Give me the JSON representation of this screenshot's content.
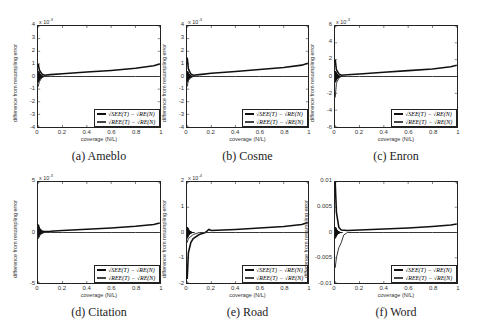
{
  "chart_data": [
    {
      "id": "a",
      "type": "line",
      "caption": "(a) Ameblo",
      "xlabel": "coverage (N/L)",
      "ylabel": "difference from resampling error",
      "y_exponent": "x 10^-3",
      "y_exponent_base": "x 10",
      "y_exponent_power": "-3",
      "xlim": [
        0,
        1
      ],
      "ylim": [
        -4,
        4
      ],
      "xticks": [
        "0",
        "0.2",
        "0.4",
        "0.6",
        "0.8",
        "1"
      ],
      "yticks": [
        "4",
        "3",
        "2",
        "1",
        "0",
        "-1",
        "-2",
        "-3",
        "-4"
      ],
      "legend": [
        "√SEE(T) − √RE(N)",
        "√REE(T) − √RE(N)"
      ],
      "legend_position": "lower right",
      "grid": false,
      "series": [
        {
          "name": "√SEE(T) − √RE(N)",
          "x": [
            0,
            0.01,
            0.03,
            0.05,
            0.1,
            0.2,
            0.4,
            0.6,
            0.8,
            0.95,
            1.0
          ],
          "values": [
            1.0,
            0.5,
            0.2,
            0.1,
            0.15,
            0.22,
            0.35,
            0.48,
            0.65,
            0.85,
            1.0
          ]
        },
        {
          "name": "√REE(T) − √RE(N)",
          "x": [
            0,
            0.01,
            0.03,
            0.05,
            0.1,
            0.2,
            0.4,
            0.6,
            0.8,
            1.0
          ],
          "values": [
            -0.8,
            -0.4,
            -0.1,
            0.0,
            0.0,
            0.0,
            0.0,
            0.0,
            0.0,
            0.0
          ]
        }
      ]
    },
    {
      "id": "b",
      "type": "line",
      "caption": "(b) Cosme",
      "xlabel": "coverage (N/L)",
      "ylabel": "difference from resampling error",
      "y_exponent": "x 10^-3",
      "y_exponent_base": "x 10",
      "y_exponent_power": "-3",
      "xlim": [
        0,
        1
      ],
      "ylim": [
        -4,
        4
      ],
      "xticks": [
        "0",
        "0.2",
        "0.4",
        "0.6",
        "0.8",
        "1"
      ],
      "yticks": [
        "4",
        "3",
        "2",
        "1",
        "0",
        "-1",
        "-2",
        "-3",
        "-4"
      ],
      "legend": [
        "√SEE(T) − √RE(N)",
        "√REE(T) − √RE(N)"
      ],
      "legend_position": "lower right",
      "grid": false,
      "series": [
        {
          "name": "√SEE(T) − √RE(N)",
          "x": [
            0,
            0.01,
            0.03,
            0.05,
            0.1,
            0.2,
            0.4,
            0.6,
            0.8,
            0.95,
            1.0
          ],
          "values": [
            1.5,
            0.6,
            0.2,
            0.1,
            0.15,
            0.25,
            0.4,
            0.55,
            0.72,
            0.9,
            1.05
          ]
        },
        {
          "name": "√REE(T) − √RE(N)",
          "x": [
            0,
            0.01,
            0.03,
            0.05,
            0.1,
            0.2,
            0.4,
            0.6,
            0.8,
            1.0
          ],
          "values": [
            -0.8,
            -0.3,
            -0.1,
            0.0,
            0.0,
            0.0,
            0.0,
            0.0,
            0.0,
            0.0
          ]
        }
      ]
    },
    {
      "id": "c",
      "type": "line",
      "caption": "(c) Enron",
      "xlabel": "coverage (N/L)",
      "ylabel": "difference from resampling error",
      "y_exponent": "x 10^-3",
      "y_exponent_base": "x 10",
      "y_exponent_power": "-3",
      "xlim": [
        0,
        1
      ],
      "ylim": [
        -6,
        6
      ],
      "xticks": [
        "0",
        "0.2",
        "0.4",
        "0.6",
        "0.8",
        "1"
      ],
      "yticks": [
        "6",
        "4",
        "2",
        "0",
        "-2",
        "-4",
        "-6"
      ],
      "legend": [
        "√SEE(T) − √RE(N)",
        "√REE(T) − √RE(N)"
      ],
      "legend_position": "lower right",
      "grid": false,
      "series": [
        {
          "name": "√SEE(T) − √RE(N)",
          "x": [
            0,
            0.01,
            0.03,
            0.05,
            0.1,
            0.2,
            0.4,
            0.6,
            0.8,
            0.95,
            1.0
          ],
          "values": [
            2.0,
            0.8,
            0.3,
            0.15,
            0.2,
            0.3,
            0.5,
            0.7,
            0.9,
            1.15,
            1.35
          ]
        },
        {
          "name": "√REE(T) − √RE(N)",
          "x": [
            0,
            0.01,
            0.03,
            0.05,
            0.1,
            0.2,
            0.4,
            0.6,
            0.8,
            1.0
          ],
          "values": [
            -2.5,
            -0.8,
            -0.2,
            0.0,
            0.0,
            0.0,
            0.0,
            0.0,
            0.0,
            0.0
          ]
        }
      ]
    },
    {
      "id": "d",
      "type": "line",
      "caption": "(d) Citation",
      "xlabel": "coverage (N/L)",
      "ylabel": "difference from resampling error",
      "y_exponent": "x 10^-3",
      "y_exponent_base": "x 10",
      "y_exponent_power": "-3",
      "xlim": [
        0,
        1
      ],
      "ylim": [
        -5,
        5
      ],
      "xticks": [
        "0",
        "0.2",
        "0.4",
        "0.6",
        "0.8",
        "1"
      ],
      "yticks": [
        "5",
        "0",
        "-5"
      ],
      "legend": [
        "√SEE(T) − √RE(N)",
        "√REE(T) − √RE(N)"
      ],
      "legend_position": "lower right",
      "grid": false,
      "series": [
        {
          "name": "√SEE(T) − √RE(N)",
          "x": [
            0,
            0.01,
            0.03,
            0.05,
            0.1,
            0.2,
            0.4,
            0.6,
            0.8,
            0.95,
            1.0
          ],
          "values": [
            0.8,
            0.4,
            0.15,
            0.1,
            0.12,
            0.2,
            0.32,
            0.45,
            0.62,
            0.8,
            0.95
          ]
        },
        {
          "name": "√REE(T) − √RE(N)",
          "x": [
            0,
            0.01,
            0.03,
            0.05,
            0.1,
            0.2,
            0.4,
            0.6,
            0.8,
            1.0
          ],
          "values": [
            -0.6,
            -0.3,
            -0.1,
            0.0,
            0.0,
            0.0,
            0.0,
            0.0,
            0.0,
            0.0
          ]
        }
      ]
    },
    {
      "id": "e",
      "type": "line",
      "caption": "(e) Road",
      "xlabel": "coverage (N/L)",
      "ylabel": "difference from resampling error",
      "y_exponent": "x 10^-4",
      "y_exponent_base": "x 10",
      "y_exponent_power": "-4",
      "xlim": [
        0,
        1
      ],
      "ylim": [
        -2.5,
        2.5
      ],
      "xticks": [
        "0",
        "0.2",
        "0.4",
        "0.6",
        "0.8",
        "1"
      ],
      "yticks": [
        "2",
        "1",
        "0",
        "-1",
        "-2"
      ],
      "legend": [
        "√SEE(T) − √RE(N)",
        "√REE(T) − √RE(N)"
      ],
      "legend_position": "lower right",
      "grid": false,
      "series": [
        {
          "name": "√SEE(T) − √RE(N)",
          "x": [
            0,
            0.01,
            0.03,
            0.05,
            0.1,
            0.15,
            0.18,
            0.2,
            0.4,
            0.6,
            0.8,
            0.95,
            1.0
          ],
          "values": [
            -2.3,
            -1.0,
            -0.5,
            -0.3,
            -0.1,
            0.0,
            0.15,
            0.1,
            0.15,
            0.22,
            0.3,
            0.4,
            0.5
          ]
        },
        {
          "name": "√REE(T) − √RE(N)",
          "x": [
            0,
            0.01,
            0.03,
            0.05,
            0.1,
            0.2,
            0.4,
            0.6,
            0.8,
            1.0
          ],
          "values": [
            -0.5,
            -0.3,
            -0.2,
            -0.1,
            0.0,
            0.0,
            0.0,
            0.0,
            0.0,
            0.0
          ]
        }
      ]
    },
    {
      "id": "f",
      "type": "line",
      "caption": "(f) Word",
      "xlabel": "coverage (N/L)",
      "ylabel": "difference from resampling error",
      "y_exponent": "",
      "xlim": [
        0,
        1
      ],
      "ylim": [
        -0.01,
        0.01
      ],
      "xticks": [
        "0",
        "0.2",
        "0.4",
        "0.6",
        "0.8",
        "1"
      ],
      "yticks": [
        "0.01",
        "0.005",
        "0",
        "-0.005",
        "-0.01"
      ],
      "legend": [
        "√SEE(T) − √RE(N)",
        "√REE(T) − √RE(N)"
      ],
      "legend_position": "lower right",
      "grid": false,
      "series": [
        {
          "name": "√SEE(T) − √RE(N)",
          "x": [
            0,
            0.01,
            0.03,
            0.05,
            0.1,
            0.2,
            0.4,
            0.6,
            0.8,
            0.95,
            1.0
          ],
          "values": [
            0.01,
            0.004,
            0.001,
            0.0005,
            0.0004,
            0.0005,
            0.0007,
            0.0009,
            0.0012,
            0.0015,
            0.0017
          ]
        },
        {
          "name": "√REE(T) − √RE(N)",
          "x": [
            0,
            0.01,
            0.03,
            0.05,
            0.07,
            0.1,
            0.2,
            0.4,
            0.6,
            0.8,
            1.0
          ],
          "values": [
            -0.007,
            -0.005,
            -0.003,
            -0.002,
            -0.0005,
            0.0,
            0.0,
            0.0,
            0.0,
            0.0,
            0.0
          ]
        }
      ]
    }
  ]
}
